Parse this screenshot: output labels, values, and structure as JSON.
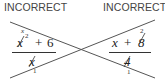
{
  "left": {
    "label": "INCORRECT",
    "numerator": {
      "term": "x",
      "exponent": "2",
      "operator": "+",
      "constant": "6",
      "cancel_note": "x"
    },
    "denominator": {
      "term": "x",
      "cancel_note": "1"
    }
  },
  "right": {
    "label": "INCORRECT",
    "numerator": {
      "term": "x",
      "operator": "+",
      "constant": "8",
      "cancel_note": "2"
    },
    "denominator": {
      "term": "4",
      "cancel_note": "1"
    }
  },
  "colors": {
    "line": "#555555",
    "text": "#222222"
  }
}
